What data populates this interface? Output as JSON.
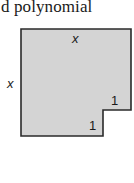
{
  "caption": {
    "text": "d polynomial"
  },
  "figure": {
    "shape": "rectangle-with-bottom-right-notch",
    "fill_color": "#d4d4d4",
    "stroke_color": "#2a2a2a",
    "labels": {
      "top": "x",
      "left": "x",
      "notch_right": "1",
      "notch_bottom": "1"
    }
  }
}
